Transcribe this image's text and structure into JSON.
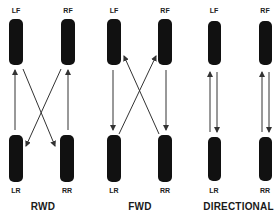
{
  "diagrams": [
    {
      "title": "RWD",
      "tires": {
        "lf": "LF",
        "rf": "RF",
        "lr": "LR",
        "rr": "RR"
      },
      "arrows": [
        "LR → LF (straight)",
        "RR → RF (straight)",
        "LF → RR (cross)",
        "RF → LR (cross)"
      ]
    },
    {
      "title": "FWD",
      "tires": {
        "lf": "LF",
        "rf": "RF",
        "lr": "LR",
        "rr": "RR"
      },
      "arrows": [
        "LF → LR (straight)",
        "RF → RR (straight)",
        "LR → RF (cross)",
        "RR → LF (cross)"
      ]
    },
    {
      "title": "DIRECTIONAL",
      "tires": {
        "lf": "LF",
        "rf": "RF",
        "lr": "LR",
        "rr": "RR"
      },
      "arrows": [
        "LF ↔ LR",
        "RF ↔ RR"
      ]
    }
  ],
  "colors": {
    "tire": "#111111",
    "arrow": "#333333",
    "background": "#ffffff"
  }
}
